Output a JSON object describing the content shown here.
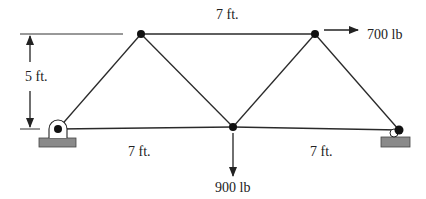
{
  "diagram": {
    "type": "truss",
    "colors": {
      "member": "#2a2a2a",
      "node": "#111111",
      "support_base": "#8a8a8a",
      "dimension": "#333333"
    },
    "nodes": [
      {
        "id": "A",
        "role": "left-pin-support",
        "x": 58,
        "y": 129
      },
      {
        "id": "B",
        "role": "top-left",
        "x": 141,
        "y": 34
      },
      {
        "id": "C",
        "role": "bottom-middle",
        "x": 233,
        "y": 127
      },
      {
        "id": "D",
        "role": "top-right",
        "x": 315,
        "y": 34
      },
      {
        "id": "E",
        "role": "right-roller-support",
        "x": 399,
        "y": 130
      }
    ],
    "members": [
      [
        "A",
        "B"
      ],
      [
        "B",
        "C"
      ],
      [
        "C",
        "D"
      ],
      [
        "D",
        "E"
      ],
      [
        "B",
        "D"
      ],
      [
        "A",
        "C"
      ],
      [
        "C",
        "E"
      ]
    ],
    "labels": {
      "top_span": "7 ft.",
      "height": "5 ft.",
      "bottom_left_span": "7 ft.",
      "bottom_right_span": "7 ft."
    },
    "loads": [
      {
        "node": "D",
        "direction": "right",
        "label": "700 lb"
      },
      {
        "node": "C",
        "direction": "down",
        "label": "900 lb"
      }
    ]
  }
}
